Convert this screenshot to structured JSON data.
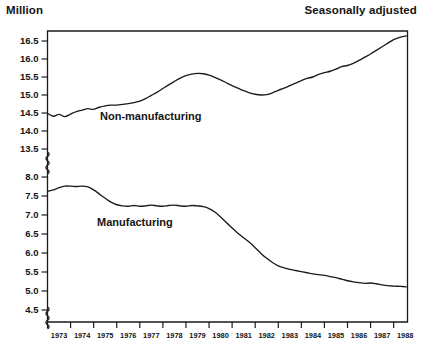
{
  "header": {
    "unit_label": "Million",
    "note_label": "Seasonally adjusted"
  },
  "chart_data": {
    "type": "line",
    "title": "",
    "subtitle": "",
    "xlabel": "",
    "ylabel": "Million",
    "annotation": "Seasonally adjusted",
    "grid": false,
    "legend_position": "inline-labels",
    "axis_break": true,
    "axis_break_between": [
      13.5,
      8.0
    ],
    "axis_break_below": 4.5,
    "yticks_upper": [
      "16.5",
      "16.0",
      "15.5",
      "15.0",
      "14.5",
      "14.0",
      "13.5"
    ],
    "yticks_lower": [
      "8.0",
      "7.5",
      "7.0",
      "6.5",
      "6.0",
      "5.5",
      "5.0",
      "4.5"
    ],
    "ylim_upper": [
      13.5,
      16.5
    ],
    "ylim_lower": [
      4.5,
      8.0
    ],
    "xticks": [
      "1973",
      "1974",
      "1975",
      "1976",
      "1977",
      "1978",
      "1979",
      "1980",
      "1981",
      "1982",
      "1983",
      "1984",
      "1985",
      "1986",
      "1987",
      "1988"
    ],
    "xlim": [
      1973,
      1988.6
    ],
    "series": [
      {
        "name": "Non-manufacturing",
        "label": "Non-manufacturing",
        "panel": "upper",
        "x": [
          1973.0,
          1973.25,
          1973.5,
          1973.75,
          1974.0,
          1974.25,
          1974.5,
          1974.75,
          1975.0,
          1975.25,
          1975.5,
          1975.75,
          1976.0,
          1976.25,
          1976.5,
          1976.75,
          1977.0,
          1977.25,
          1977.5,
          1977.75,
          1978.0,
          1978.25,
          1978.5,
          1978.75,
          1979.0,
          1979.25,
          1979.5,
          1979.75,
          1980.0,
          1980.25,
          1980.5,
          1980.75,
          1981.0,
          1981.25,
          1981.5,
          1981.75,
          1982.0,
          1982.25,
          1982.5,
          1982.75,
          1983.0,
          1983.25,
          1983.5,
          1983.75,
          1984.0,
          1984.25,
          1984.5,
          1984.75,
          1985.0,
          1985.25,
          1985.5,
          1985.75,
          1986.0,
          1986.25,
          1986.5,
          1986.75,
          1987.0,
          1987.25,
          1987.5,
          1987.75,
          1988.0,
          1988.3,
          1988.55
        ],
        "y": [
          14.49,
          14.41,
          14.46,
          14.4,
          14.47,
          14.54,
          14.58,
          14.62,
          14.6,
          14.66,
          14.7,
          14.72,
          14.72,
          14.74,
          14.76,
          14.79,
          14.83,
          14.9,
          14.99,
          15.08,
          15.18,
          15.28,
          15.38,
          15.47,
          15.54,
          15.58,
          15.6,
          15.59,
          15.55,
          15.49,
          15.42,
          15.34,
          15.26,
          15.19,
          15.12,
          15.06,
          15.02,
          15.0,
          15.01,
          15.06,
          15.13,
          15.19,
          15.26,
          15.33,
          15.4,
          15.46,
          15.5,
          15.57,
          15.62,
          15.66,
          15.72,
          15.79,
          15.82,
          15.88,
          15.96,
          16.05,
          16.14,
          16.24,
          16.34,
          16.44,
          16.54,
          16.61,
          16.64
        ]
      },
      {
        "name": "Manufacturing",
        "label": "Manufacturing",
        "panel": "lower",
        "x": [
          1973.0,
          1973.25,
          1973.5,
          1973.75,
          1974.0,
          1974.25,
          1974.5,
          1974.75,
          1975.0,
          1975.25,
          1975.5,
          1975.75,
          1976.0,
          1976.25,
          1976.5,
          1976.75,
          1977.0,
          1977.25,
          1977.5,
          1977.75,
          1978.0,
          1978.25,
          1978.5,
          1978.75,
          1979.0,
          1979.25,
          1979.5,
          1979.75,
          1980.0,
          1980.25,
          1980.5,
          1980.75,
          1981.0,
          1981.25,
          1981.5,
          1981.75,
          1982.0,
          1982.25,
          1982.5,
          1982.75,
          1983.0,
          1983.25,
          1983.5,
          1983.75,
          1984.0,
          1984.25,
          1984.5,
          1984.75,
          1985.0,
          1985.25,
          1985.5,
          1985.75,
          1986.0,
          1986.25,
          1986.5,
          1986.75,
          1987.0,
          1987.25,
          1987.5,
          1987.75,
          1988.0,
          1988.3,
          1988.55
        ],
        "y": [
          7.62,
          7.66,
          7.72,
          7.76,
          7.76,
          7.75,
          7.76,
          7.74,
          7.66,
          7.55,
          7.44,
          7.34,
          7.27,
          7.24,
          7.23,
          7.25,
          7.23,
          7.24,
          7.26,
          7.24,
          7.23,
          7.25,
          7.26,
          7.24,
          7.23,
          7.25,
          7.24,
          7.22,
          7.17,
          7.08,
          6.95,
          6.8,
          6.66,
          6.52,
          6.4,
          6.28,
          6.14,
          5.99,
          5.86,
          5.75,
          5.66,
          5.61,
          5.57,
          5.54,
          5.51,
          5.48,
          5.45,
          5.43,
          5.41,
          5.38,
          5.35,
          5.31,
          5.27,
          5.24,
          5.22,
          5.2,
          5.21,
          5.19,
          5.16,
          5.14,
          5.13,
          5.12,
          5.11
        ]
      }
    ]
  }
}
